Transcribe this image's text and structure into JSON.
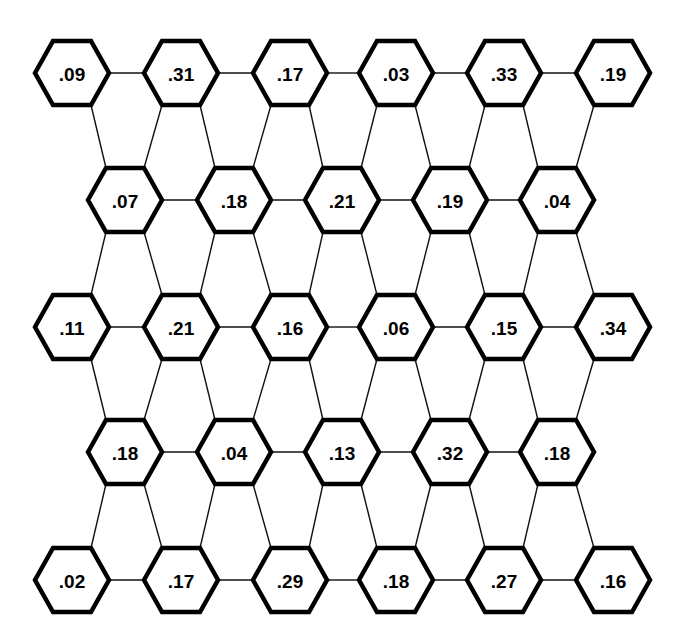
{
  "diagram": {
    "type": "hexagonal-node-lattice",
    "rows": [
      {
        "y": 73,
        "x": [
          72,
          181,
          290,
          396,
          504,
          613
        ],
        "values": [
          ".09",
          ".31",
          ".17",
          ".03",
          ".33",
          ".19"
        ]
      },
      {
        "y": 200,
        "x": [
          125,
          234,
          342,
          450,
          557
        ],
        "values": [
          ".07",
          ".18",
          ".21",
          ".19",
          ".04"
        ]
      },
      {
        "y": 327,
        "x": [
          72,
          181,
          290,
          396,
          504,
          613
        ],
        "values": [
          ".11",
          ".21",
          ".16",
          ".06",
          ".15",
          ".34"
        ]
      },
      {
        "y": 452,
        "x": [
          125,
          234,
          342,
          450,
          557
        ],
        "values": [
          ".18",
          ".04",
          ".13",
          ".32",
          ".18"
        ]
      },
      {
        "y": 580,
        "x": [
          72,
          181,
          290,
          396,
          504,
          613
        ],
        "values": [
          ".02",
          ".17",
          ".29",
          ".18",
          ".27",
          ".16"
        ]
      }
    ],
    "hex": {
      "half_width": 37,
      "half_height": 32,
      "inset": 18
    },
    "colors": {
      "stroke": "#000000",
      "fill": "#ffffff",
      "edge": "#111111",
      "text": "#000000"
    }
  }
}
